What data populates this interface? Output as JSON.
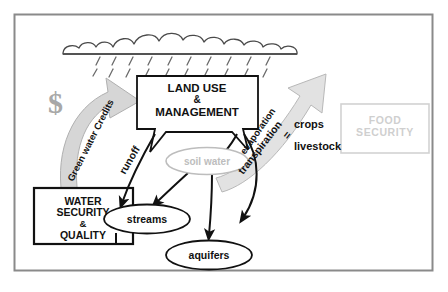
{
  "figure": {
    "frame": {
      "border_color": "#8a8a8a"
    },
    "background": "#ffffff"
  },
  "colors": {
    "ink": "#111111",
    "gray_arrow_fill": "#d6d6d6",
    "gray_arrow_stroke": "#b0b0b0",
    "soil_water_gray": "#bdbdbd",
    "faint_gray": "#cfcfcf",
    "frame_gray": "#8a8a8a",
    "cloud_stroke": "#4a4a4a",
    "rain_stroke": "#6a6a6a"
  },
  "nodes": {
    "cloud": {
      "name": "rain-cloud",
      "label": ""
    },
    "land_use": {
      "name": "land-use-management-box",
      "line1": "LAND USE",
      "line2": "&",
      "line3": "MANAGEMENT"
    },
    "water_security": {
      "name": "water-security-quality-box",
      "line1": "WATER",
      "line2": "SECURITY",
      "line3": "&",
      "line4": "QUALITY"
    },
    "food_security": {
      "name": "food-security-box",
      "line1": "FOOD",
      "line2": "SECURITY"
    },
    "soil_water": {
      "name": "soil-water-ellipse",
      "label": "soil water"
    },
    "streams": {
      "name": "streams-ellipse",
      "label": "streams"
    },
    "aquifers": {
      "name": "aquifers-ellipse",
      "label": "aquifers"
    }
  },
  "labels": {
    "dollar_sign": "$",
    "green_water_credits": "Green water Credits",
    "runoff": "runoff",
    "evaporation": "evaporation",
    "transpiration": "transpiration",
    "equals": "=",
    "crops": "crops",
    "livestock": "livestock"
  },
  "flows": [
    {
      "name": "rain-to-land-use",
      "from": "cloud",
      "to": "land_use",
      "style": "dashed-rain"
    },
    {
      "name": "land-use-to-runoff",
      "from": "land_use",
      "to": "streams",
      "style": "solid-arrow",
      "label": "runoff"
    },
    {
      "name": "land-use-to-soil-water",
      "from": "land_use",
      "to": "soil_water",
      "style": "solid-arrow"
    },
    {
      "name": "soil-water-to-streams",
      "from": "soil_water",
      "to": "streams",
      "style": "solid-arrow"
    },
    {
      "name": "soil-water-to-aquifers",
      "from": "soil_water",
      "to": "aquifers",
      "style": "solid-arrow"
    },
    {
      "name": "aquifers-to-streams",
      "from": "aquifers",
      "to": "streams",
      "style": "solid-arrow"
    },
    {
      "name": "streams-to-water-security",
      "from": "streams",
      "to": "water_security",
      "style": "solid-line"
    },
    {
      "name": "water-security-to-land-use",
      "from": "water_security",
      "to": "land_use",
      "style": "big-gray-arrow",
      "label": "Green water Credits"
    },
    {
      "name": "soil-water-to-food-security",
      "from": "soil_water",
      "to": "food_security",
      "style": "big-gray-arrow",
      "label": "evaporation / transpiration"
    }
  ]
}
